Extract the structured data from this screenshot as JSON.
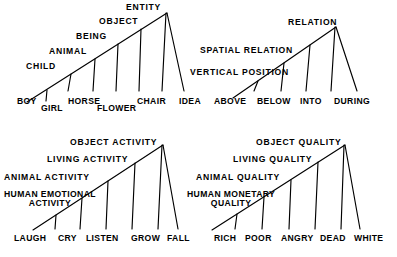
{
  "figure": {
    "background_color": "#ffffff",
    "line_color": "#000000",
    "text_color": "#000000"
  },
  "quadrants": [
    {
      "id": "entity",
      "apex_label": "ENTITY",
      "levels": [
        "CHILD",
        "ANIMAL",
        "BEING",
        "OBJECT",
        "ENTITY"
      ],
      "leaves": [
        "BOY",
        "GIRL",
        "HORSE",
        "FLOWER",
        "CHAIR",
        "IDEA"
      ]
    },
    {
      "id": "relation",
      "apex_label": "RELATION",
      "levels": [
        "VERTICAL POSITION",
        "SPATIAL RELATION",
        "RELATION"
      ],
      "leaves": [
        "ABOVE",
        "BELOW",
        "INTO",
        "DURING"
      ]
    },
    {
      "id": "activity",
      "apex_label": "OBJECT ACTIVITY",
      "levels": [
        "HUMAN EMOTIONAL ACTIVITY",
        "ANIMAL ACTIVITY",
        "LIVING ACTIVITY",
        "OBJECT ACTIVITY"
      ],
      "leaves": [
        "LAUGH",
        "CRY",
        "LISTEN",
        "GROW",
        "FALL"
      ]
    },
    {
      "id": "quality",
      "apex_label": "OBJECT QUALITY",
      "levels": [
        "HUMAN MONETARY QUALITY",
        "ANIMAL QUALITY",
        "LIVING QUALITY",
        "OBJECT QUALITY"
      ],
      "leaves": [
        "RICH",
        "POOR",
        "ANGRY",
        "DEAD",
        "WHITE"
      ]
    }
  ],
  "labels": {
    "entity_child": "CHILD",
    "entity_animal": "ANIMAL",
    "entity_being": "BEING",
    "entity_object": "OBJECT",
    "entity_entity": "ENTITY",
    "entity_boy": "BOY",
    "entity_girl": "GIRL",
    "entity_horse": "HORSE",
    "entity_flower": "FLOWER",
    "entity_chair": "CHAIR",
    "entity_idea": "IDEA",
    "relation_vertical_position": "VERTICAL POSITION",
    "relation_spatial_relation": "SPATIAL RELATION",
    "relation_relation": "RELATION",
    "relation_above": "ABOVE",
    "relation_below": "BELOW",
    "relation_into": "INTO",
    "relation_during": "DURING",
    "activity_human_emotional_1": "HUMAN EMOTIONAL",
    "activity_human_emotional_2": "ACTIVITY",
    "activity_animal": "ANIMAL ACTIVITY",
    "activity_living": "LIVING ACTIVITY",
    "activity_object": "OBJECT ACTIVITY",
    "activity_laugh": "LAUGH",
    "activity_cry": "CRY",
    "activity_listen": "LISTEN",
    "activity_grow": "GROW",
    "activity_fall": "FALL",
    "quality_human_monetary_1": "HUMAN MONETARY",
    "quality_human_monetary_2": "QUALITY",
    "quality_animal": "ANIMAL QUALITY",
    "quality_living": "LIVING QUALITY",
    "quality_object": "OBJECT QUALITY",
    "quality_rich": "RICH",
    "quality_poor": "POOR",
    "quality_angry": "ANGRY",
    "quality_dead": "DEAD",
    "quality_white": "WHITE"
  }
}
